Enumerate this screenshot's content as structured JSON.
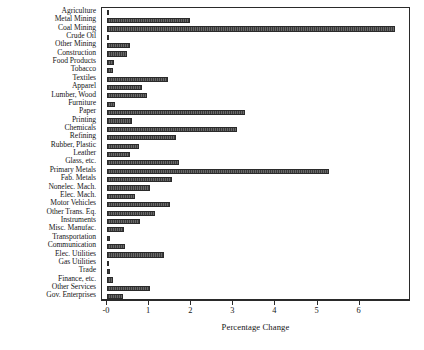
{
  "chart_data": {
    "type": "bar",
    "orientation": "horizontal",
    "title": "",
    "xlabel": "Percentage Change",
    "ylabel": "",
    "xlim": [
      -0.12,
      7.22
    ],
    "xticks": [
      0,
      1,
      2,
      3,
      4,
      5,
      6
    ],
    "xticklabels": [
      "-0",
      "1",
      "2",
      "3",
      "4",
      "5",
      "6"
    ],
    "grid": false,
    "legend": null,
    "bar_color": "#4a4a4a",
    "categories": [
      "Agriculture",
      "Metal Mining",
      "Coal Mining",
      "Crude Oil",
      "Other Mining",
      "Construction",
      "Food Products",
      "Tobacco",
      "Textiles",
      "Apparel",
      "Lumber, Wood",
      "Furniture",
      "Paper",
      "Printing",
      "Chemicals",
      "Refining",
      "Rubber, Plastic",
      "Leather",
      "Glass, etc.",
      "Primary Metals",
      "Fab. Metals",
      "Nonelec. Mach.",
      "Elec. Mach.",
      "Motor Vehicles",
      "Other Trans. Eq.",
      "Instruments",
      "Misc. Manufac.",
      "Transportation",
      "Communication",
      "Elec. Utilities",
      "Gas Utilities",
      "Trade",
      "Finance, etc.",
      "Other Services",
      "Gov. Enterprises"
    ],
    "values": [
      0.02,
      1.96,
      6.83,
      0.03,
      0.54,
      0.47,
      0.17,
      0.13,
      1.44,
      0.82,
      0.96,
      0.19,
      3.28,
      0.6,
      3.09,
      1.64,
      0.76,
      0.55,
      1.7,
      5.27,
      1.55,
      1.02,
      0.66,
      1.5,
      1.14,
      0.78,
      0.4,
      0.07,
      0.43,
      1.36,
      0.03,
      0.07,
      0.14,
      1.02,
      0.38
    ]
  }
}
